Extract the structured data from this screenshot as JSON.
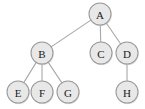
{
  "diagram": {
    "type": "tree",
    "background_color": "#ffffff",
    "node_fill_color": "#e8e8e8",
    "node_stroke_color": "#9a9a9a",
    "edge_color": "#a8a8a8",
    "label_color": "#1a1a1a",
    "node_radius": 11,
    "root": "A",
    "nodes": [
      {
        "id": "A",
        "label": "A",
        "x": 100,
        "y": 14,
        "level": 0
      },
      {
        "id": "B",
        "label": "B",
        "x": 42,
        "y": 53,
        "level": 1
      },
      {
        "id": "C",
        "label": "C",
        "x": 101,
        "y": 53,
        "level": 1
      },
      {
        "id": "D",
        "label": "D",
        "x": 127,
        "y": 53,
        "level": 1
      },
      {
        "id": "E",
        "label": "E",
        "x": 18,
        "y": 92,
        "level": 2
      },
      {
        "id": "F",
        "label": "F",
        "x": 42,
        "y": 92,
        "level": 2
      },
      {
        "id": "G",
        "label": "G",
        "x": 68,
        "y": 92,
        "level": 2
      },
      {
        "id": "H",
        "label": "H",
        "x": 127,
        "y": 92,
        "level": 2
      }
    ],
    "edges": [
      {
        "from": "A",
        "to": "B"
      },
      {
        "from": "A",
        "to": "C"
      },
      {
        "from": "A",
        "to": "D"
      },
      {
        "from": "B",
        "to": "E"
      },
      {
        "from": "B",
        "to": "F"
      },
      {
        "from": "B",
        "to": "G"
      },
      {
        "from": "D",
        "to": "H"
      }
    ]
  }
}
